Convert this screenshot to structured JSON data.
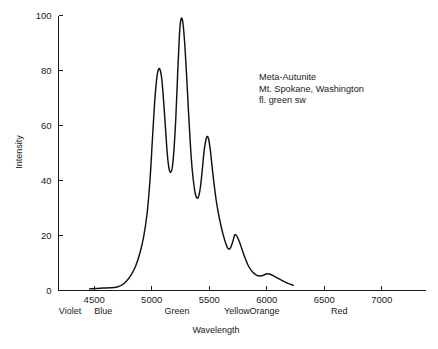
{
  "chart_data": {
    "type": "line",
    "title": "",
    "xlabel": "Wavelength",
    "ylabel": "Intensity",
    "xlim": [
      4190,
      7380
    ],
    "ylim": [
      0,
      100
    ],
    "grid": false,
    "legend_position": "none",
    "xticks": [
      4500,
      5000,
      5500,
      6000,
      6500,
      7000
    ],
    "xtick_labels": [
      "4500",
      "5000",
      "5500",
      "6000",
      "6500",
      "7000"
    ],
    "yticks": [
      0,
      20,
      40,
      60,
      80,
      100
    ],
    "ytick_labels": [
      "0",
      "20",
      "40",
      "60",
      "80",
      "100"
    ],
    "color_bands": [
      {
        "label": "Violet",
        "wavelength": 4290
      },
      {
        "label": "Blue",
        "wavelength": 4580
      },
      {
        "label": "Green",
        "wavelength": 5220
      },
      {
        "label": "Yellow",
        "wavelength": 5740
      },
      {
        "label": "Orange",
        "wavelength": 5980
      },
      {
        "label": "Red",
        "wavelength": 6630
      }
    ],
    "annotations": [
      "Meta-Autunite",
      "Mt. Spokane, Washington",
      "fl. green sw"
    ],
    "series": [
      {
        "name": "Meta-Autunite fluorescence spectrum",
        "color": "#111111",
        "x": [
          4460,
          4520,
          4580,
          4640,
          4700,
          4740,
          4780,
          4820,
          4860,
          4900,
          4930,
          4960,
          4985,
          5005,
          5025,
          5045,
          5060,
          5075,
          5090,
          5105,
          5120,
          5135,
          5150,
          5165,
          5180,
          5195,
          5210,
          5225,
          5240,
          5250,
          5262,
          5275,
          5290,
          5305,
          5320,
          5335,
          5350,
          5365,
          5380,
          5395,
          5410,
          5425,
          5440,
          5455,
          5470,
          5482,
          5495,
          5510,
          5525,
          5540,
          5560,
          5580,
          5600,
          5620,
          5645,
          5665,
          5685,
          5705,
          5722,
          5740,
          5760,
          5785,
          5810,
          5840,
          5875,
          5910,
          5945,
          5975,
          6000,
          6030,
          6060,
          6095,
          6135,
          6180,
          6230
        ],
        "y": [
          0.6,
          0.7,
          0.9,
          1.0,
          1.3,
          2.0,
          3.4,
          5.6,
          8.8,
          14.0,
          19.5,
          28.0,
          40.0,
          54.0,
          68.0,
          77.5,
          80.5,
          80.0,
          76.0,
          68.0,
          59.0,
          50.0,
          44.5,
          43.0,
          45.0,
          52.0,
          63.0,
          78.0,
          92.0,
          97.5,
          99.0,
          96.0,
          88.0,
          77.0,
          65.0,
          54.0,
          45.0,
          39.0,
          35.0,
          33.6,
          34.5,
          38.0,
          44.0,
          50.5,
          54.5,
          56.0,
          55.0,
          51.0,
          45.0,
          39.5,
          33.0,
          28.0,
          24.0,
          20.5,
          17.0,
          15.2,
          15.5,
          17.8,
          20.2,
          19.8,
          18.0,
          15.0,
          12.0,
          9.0,
          6.8,
          5.6,
          5.3,
          5.6,
          6.1,
          5.9,
          5.3,
          4.5,
          3.6,
          2.7,
          1.9
        ],
        "peaks": [
          {
            "wavelength": 5060,
            "intensity": 80.5
          },
          {
            "wavelength": 5262,
            "intensity": 99.0
          },
          {
            "wavelength": 5482,
            "intensity": 56.0
          },
          {
            "wavelength": 5722,
            "intensity": 20.2
          },
          {
            "wavelength": 6000,
            "intensity": 6.1
          }
        ],
        "valleys": [
          {
            "wavelength": 5165,
            "intensity": 43.0
          },
          {
            "wavelength": 5395,
            "intensity": 33.6
          },
          {
            "wavelength": 5665,
            "intensity": 15.2
          },
          {
            "wavelength": 5945,
            "intensity": 5.3
          }
        ]
      }
    ]
  }
}
